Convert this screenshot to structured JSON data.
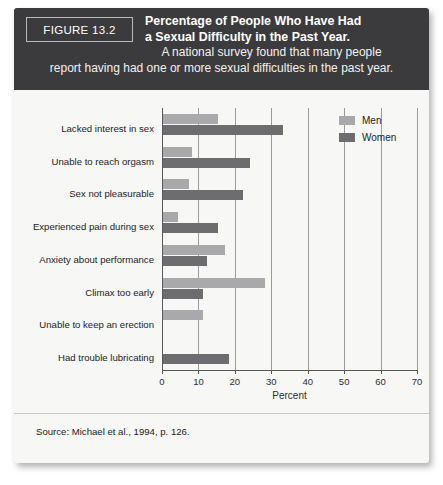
{
  "figure": {
    "number_label": "FIGURE 13.2",
    "title_line_1": "Percentage of People Who Have Had",
    "title_line_2": "a Sexual Difficulty in the Past Year.",
    "subtitle_line_1": "A national survey found that many people",
    "subtitle_line_2": "report having had one or more sexual difficulties in the past year.",
    "source": "Source: Michael et al., 1994, p. 126."
  },
  "legend": {
    "position": "top-right",
    "entries": [
      {
        "label": "Men",
        "color": "#a9a9ab"
      },
      {
        "label": "Women",
        "color": "#6d6d70"
      }
    ]
  },
  "colors": {
    "men": "#a9a9ab",
    "women": "#6d6d70",
    "header_band": "#3b3b3d",
    "card_background": "#f7f7f5",
    "axis": "#58585a",
    "gridline": "#9a9a9c"
  },
  "chart_data": {
    "type": "bar",
    "orientation": "horizontal",
    "title": "Percentage of People Who Have Had a Sexual Difficulty in the Past Year.",
    "subtitle": "A national survey found that many people report having had one or more sexual difficulties in the past year.",
    "xlabel": "Percent",
    "ylabel": "",
    "xlim": [
      0,
      70
    ],
    "xticks": [
      0,
      10,
      20,
      30,
      40,
      50,
      60,
      70
    ],
    "xtick_labels": [
      "0",
      "10",
      "20",
      "30",
      "40",
      "50",
      "60",
      "70"
    ],
    "grid": true,
    "grid_axis": "x",
    "legend_position": "top-right",
    "categories": [
      "Lacked interest in sex",
      "Unable to reach orgasm",
      "Sex not pleasurable",
      "Experienced pain during sex",
      "Anxiety about performance",
      "Climax too early",
      "Unable to keep an erection",
      "Had trouble lubricating"
    ],
    "series": [
      {
        "name": "Men",
        "color": "#a9a9ab",
        "values": [
          15,
          8,
          7,
          4,
          17,
          28,
          11,
          0
        ]
      },
      {
        "name": "Women",
        "color": "#6d6d70",
        "values": [
          33,
          24,
          22,
          15,
          12,
          11,
          0,
          18
        ]
      }
    ]
  }
}
